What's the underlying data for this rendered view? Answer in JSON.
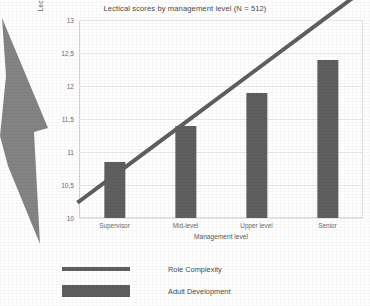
{
  "chart_data": {
    "type": "bar",
    "title": "Lectical scores by management level (N = 512)",
    "xlabel": "Management level",
    "ylabel": "Lectical score",
    "categories": [
      "Supervisor",
      "Mid-level",
      "Upper level",
      "Senior"
    ],
    "ylim": [
      10,
      13
    ],
    "yticks": [
      10,
      10.5,
      11,
      11.5,
      12,
      12.5,
      13
    ],
    "ytick_labels": [
      "10",
      "10,5",
      "11",
      "11,5",
      "12",
      "12,5",
      "13"
    ],
    "grid": true,
    "legend_position": "bottom-left",
    "series": [
      {
        "name": "Role Complexity",
        "type": "line",
        "color": "#5f5f5f",
        "values": [
          10.65,
          11.45,
          12.25,
          13.05
        ]
      },
      {
        "name": "Adult Development",
        "type": "bar",
        "color": "#5f5f5f",
        "values": [
          10.85,
          11.4,
          11.9,
          12.4
        ]
      }
    ]
  },
  "legend": {
    "items": [
      {
        "label": "Role Complexity",
        "swatch": "line"
      },
      {
        "label": "Adult Development",
        "swatch": "bar"
      }
    ]
  },
  "colors": {
    "series": "#5f5f5f",
    "grid": "#ececec",
    "text": "#595959",
    "decoration": "#6f6f6f"
  }
}
